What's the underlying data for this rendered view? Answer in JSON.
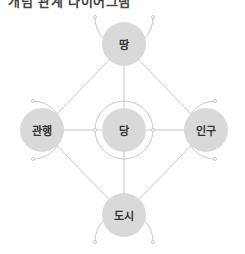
{
  "title": "개념 관계 다이어그램",
  "colors": {
    "node_fill": "#d9d9d9",
    "line": "#c8c8c8",
    "text": "#333333"
  },
  "nodes": {
    "top": {
      "label": "땅"
    },
    "center": {
      "label": "당"
    },
    "left": {
      "label": "관행"
    },
    "right": {
      "label": "인구"
    },
    "bottom": {
      "label": "도시"
    }
  }
}
